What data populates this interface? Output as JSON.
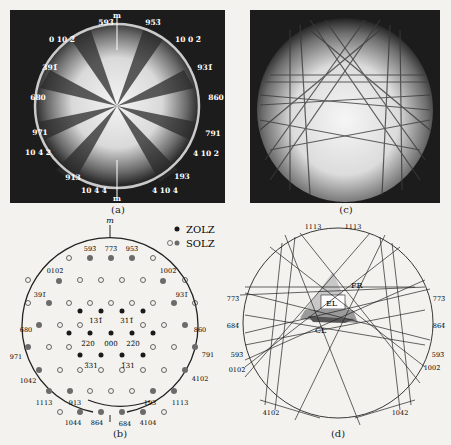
{
  "figure": {
    "panels": {
      "a": {
        "caption": "(a)",
        "mirror_label": "m",
        "labels": [
          {
            "text": "59̅3̅",
            "display": "593̄",
            "x": 106,
            "y": 23
          },
          {
            "text": "953̄",
            "x": 152,
            "y": 23
          },
          {
            "text": "0 10 2̄",
            "x": 62,
            "y": 40
          },
          {
            "text": "100̄ 2̄",
            "display": "10 0 2̄",
            "x": 188,
            "y": 40
          },
          {
            "text": "391̄",
            "x": 50,
            "y": 67
          },
          {
            "text": "9̅3̅1̅",
            "display": "931̄",
            "x": 200,
            "y": 67
          },
          {
            "text": "6̅80",
            "display": "680",
            "x": 39,
            "y": 98
          },
          {
            "text": "860",
            "x": 214,
            "y": 98
          },
          {
            "text": "9̅71",
            "display": "971",
            "x": 40,
            "y": 133
          },
          {
            "text": "7̅91",
            "display": "791",
            "x": 211,
            "y": 133
          },
          {
            "text": "10 4 2",
            "x": 38,
            "y": 152
          },
          {
            "text": "4 10 2",
            "x": 203,
            "y": 152
          },
          {
            "text": "9̅13",
            "display": "913",
            "x": 72,
            "y": 175
          },
          {
            "text": "1̅9 3",
            "display": "193",
            "x": 177,
            "y": 175
          },
          {
            "text": "10 4 4",
            "x": 84,
            "y": 190
          },
          {
            "text": "4 10 4",
            "x": 163,
            "y": 190
          }
        ]
      },
      "b": {
        "caption": "(b)",
        "mirror_label": "m",
        "legend": [
          {
            "label": "ZOLZ",
            "marker": "filled-dark"
          },
          {
            "label": "SOLZ",
            "marker": "open-and-filled-gray"
          }
        ],
        "center_labels": [
          "131̄",
          "311̄",
          "2̅20",
          "000",
          "22̅0",
          "3̅31",
          "1̅31"
        ],
        "rim_labels": [
          "593̄",
          "773̄",
          "953̄",
          "0102̄",
          "1002̄",
          "391̄",
          "931̄",
          "680",
          "860",
          "971",
          "791",
          "1042",
          "4102",
          "1113",
          "913",
          "193",
          "1113",
          "1044",
          "864",
          "684",
          "4104"
        ]
      },
      "c": {
        "caption": "(c)"
      },
      "d": {
        "caption": "(d)",
        "region_labels": [
          "FR",
          "EL",
          "CL"
        ],
        "line_labels": [
          "1113",
          "1113",
          "773̄",
          "773̄",
          "684̄",
          "864̄",
          "593̄",
          "593̄",
          "0102̄",
          "1002̄",
          "4102",
          "1042"
        ]
      }
    },
    "colors": {
      "background": "#f3f2ee",
      "photo_bg": "#1c1c1c",
      "ink": "#222222",
      "solz_filled": "#6b6b6b",
      "zolz": "#1a1a1a",
      "fr_shade": "#c8c8c8",
      "el_shade": "#9a9a9a",
      "cl_shade": "#555555"
    }
  }
}
